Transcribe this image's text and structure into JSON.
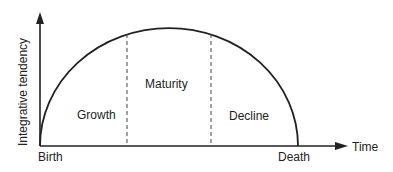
{
  "diagram": {
    "y_axis_label": "Integrative tendency",
    "x_axis_label": "Time",
    "start_label": "Birth",
    "end_label": "Death",
    "phases": [
      {
        "label": "Growth"
      },
      {
        "label": "Maturity"
      },
      {
        "label": "Decline"
      }
    ],
    "colors": {
      "ink": "#222222",
      "background": "#ffffff"
    }
  }
}
